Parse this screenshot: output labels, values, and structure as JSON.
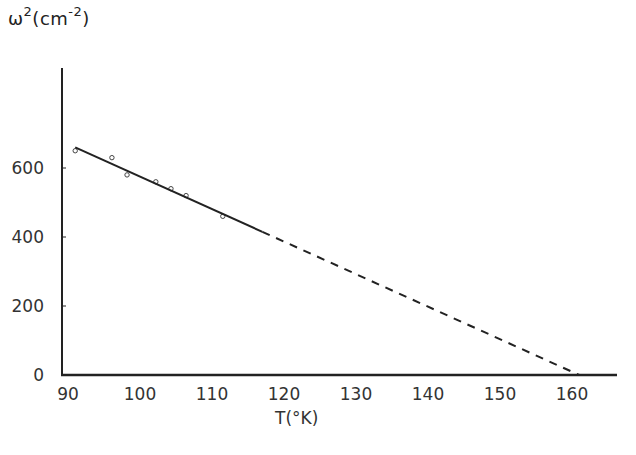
{
  "chart_data": {
    "type": "scatter",
    "title": "",
    "ylabel": "ω²(cm⁻²)",
    "ylabel_parts": {
      "base": "ω",
      "exp": "2",
      "unit_open": "(cm",
      "unit_exp": "-2",
      "unit_close": ")"
    },
    "xlabel": "T(°K)",
    "xlim": [
      90,
      166
    ],
    "ylim": [
      0,
      800
    ],
    "x_ticks": [
      90,
      100,
      110,
      120,
      130,
      140,
      150,
      160
    ],
    "y_ticks": [
      0,
      200,
      400,
      600
    ],
    "grid": false,
    "legend": null,
    "series": [
      {
        "name": "measured",
        "type": "scatter",
        "marker": "open-circle",
        "x": [
          91.0,
          96.1,
          98.2,
          102.2,
          104.3,
          106.4,
          111.5
        ],
        "y": [
          650,
          630,
          580,
          560,
          540,
          520,
          460
        ]
      },
      {
        "name": "linear fit",
        "type": "line",
        "style": "solid",
        "x": [
          91,
          117
        ],
        "y": [
          660,
          415
        ]
      },
      {
        "name": "extrapolation",
        "type": "line",
        "style": "dashed",
        "x": [
          117,
          161
        ],
        "y": [
          415,
          0
        ]
      }
    ],
    "annotations": []
  },
  "labels": {
    "y_axis_base": "ω",
    "y_axis_exp": "2",
    "y_axis_unit_open": "(cm",
    "y_axis_unit_exp": "-2",
    "y_axis_unit_close": ")",
    "x_axis": "T(°K)"
  }
}
